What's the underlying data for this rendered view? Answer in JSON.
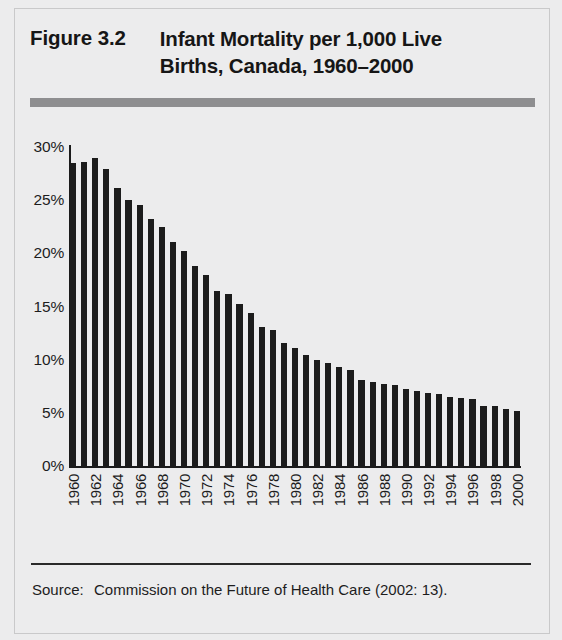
{
  "figure": {
    "number": "Figure 3.2",
    "title_line1": "Infant Mortality per 1,000 Live",
    "title_line2": "Births, Canada, 1960–2000"
  },
  "source": {
    "label": "Source:",
    "text": "Commission on the Future of Health Care (2002: 13)."
  },
  "colors": {
    "bar": "#1c1c1c",
    "rule": "#8e8e90",
    "axis": "#1b1b1b",
    "page_background": "#ececed"
  },
  "chart_data": {
    "type": "bar",
    "title": "Infant Mortality per 1,000 Live Births, Canada, 1960–2000",
    "xlabel": "",
    "ylabel": "",
    "ylim": [
      0,
      30
    ],
    "ytick_labels": [
      "30%",
      "25%",
      "20%",
      "15%",
      "10%",
      "5%",
      "0%"
    ],
    "ytick_values": [
      30,
      25,
      20,
      15,
      10,
      5,
      0
    ],
    "grid": false,
    "legend": "none",
    "xtick_interval": 2,
    "categories": [
      "1960",
      "1961",
      "1962",
      "1963",
      "1964",
      "1965",
      "1966",
      "1967",
      "1968",
      "1969",
      "1970",
      "1971",
      "1972",
      "1973",
      "1974",
      "1975",
      "1976",
      "1977",
      "1978",
      "1979",
      "1980",
      "1981",
      "1982",
      "1983",
      "1984",
      "1985",
      "1986",
      "1987",
      "1988",
      "1989",
      "1990",
      "1991",
      "1992",
      "1993",
      "1994",
      "1995",
      "1996",
      "1997",
      "1998",
      "1999",
      "2000"
    ],
    "xtick_labels_shown": [
      "1960",
      "",
      "1962",
      "",
      "1964",
      "",
      "1966",
      "",
      "1968",
      "",
      "1970",
      "",
      "1972",
      "",
      "1974",
      "",
      "1976",
      "",
      "1978",
      "",
      "1980",
      "",
      "1982",
      "",
      "1984",
      "",
      "1986",
      "",
      "1988",
      "",
      "1990",
      "",
      "1992",
      "",
      "1994",
      "",
      "1996",
      "",
      "1998",
      "",
      "2000"
    ],
    "values": [
      28.5,
      28.6,
      29.0,
      27.9,
      26.1,
      25.0,
      24.5,
      23.2,
      22.5,
      21.1,
      20.2,
      18.8,
      18.0,
      16.5,
      16.2,
      15.2,
      14.4,
      13.1,
      12.8,
      11.6,
      11.1,
      10.4,
      10.0,
      9.7,
      9.3,
      9.0,
      8.1,
      7.9,
      7.7,
      7.6,
      7.2,
      7.1,
      6.9,
      6.8,
      6.5,
      6.4,
      6.3,
      5.6,
      5.6,
      5.4,
      5.2
    ],
    "value_unit": "%",
    "bar_color": "#1c1c1c"
  }
}
